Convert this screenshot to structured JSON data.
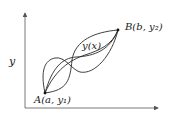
{
  "diagram": {
    "y_axis_label": "y",
    "curve_label": "y(x)",
    "point_a": {
      "label": "A(a, y₁)"
    },
    "point_b": {
      "label": "B(b, y₂)"
    },
    "colors": {
      "stroke": "#2a2a2a",
      "axis": "#555555",
      "background": "#ffffff"
    }
  }
}
